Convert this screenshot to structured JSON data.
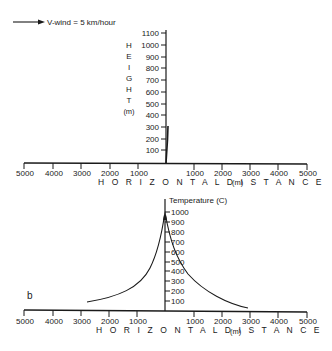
{
  "legend": {
    "wind_label": "V-wind = 5 km/hour",
    "icon": "arrow-right-icon"
  },
  "panel_a": {
    "y_axis_label_letters": [
      "H",
      "E",
      "I",
      "G",
      "H",
      "T"
    ],
    "y_axis_units": "(m)",
    "y_ticks": [
      "1100",
      "1000",
      "900",
      "800",
      "700",
      "600",
      "500",
      "400",
      "300",
      "200",
      "100"
    ],
    "x_ticks_left": [
      "5000",
      "4000",
      "3000",
      "2000",
      "1000"
    ],
    "x_ticks_right": [
      "1000",
      "2000",
      "3000",
      "4000",
      "5000"
    ],
    "x_axis_title": "H O R I Z O N T A L   D I S T A N C E",
    "x_axis_units": "(m)"
  },
  "panel_b": {
    "panel_label": "b",
    "y_axis_title": "Temperature (C)",
    "y_ticks": [
      "1000",
      "900",
      "800",
      "700",
      "600",
      "500",
      "400",
      "300",
      "200",
      "100"
    ],
    "x_ticks_left": [
      "5000",
      "4000",
      "3000",
      "2000",
      "1000"
    ],
    "x_ticks_right": [
      "1000",
      "2000",
      "3000",
      "4000",
      "5000"
    ],
    "x_axis_title": "H O R I Z O N T A L   D I S T A N C E",
    "x_axis_units": "(m)"
  },
  "colors": {
    "ink": "#1a1a1a",
    "background": "#ffffff"
  }
}
